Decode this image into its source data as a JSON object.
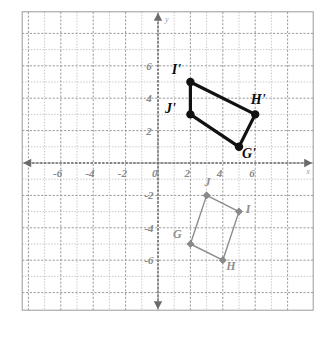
{
  "figure": {
    "type": "coordinate-plane",
    "background_color": "#ffffff",
    "grid_color": "#b9b9b9",
    "major_grid_color": "#8f8f8f",
    "axis_color": "#6b6b6b",
    "axis_names": {
      "x": "x",
      "y": "y"
    }
  },
  "axes": {
    "x_label": "x",
    "y_label": "y",
    "xlim": [
      -7.5,
      7.5
    ],
    "ylim": [
      -7.5,
      7.5
    ],
    "x_tick_labels": [
      "-6",
      "-4",
      "-2",
      "0",
      "2",
      "4",
      "6"
    ],
    "x_tick_values": [
      -6,
      -4,
      -2,
      0,
      2,
      4,
      6
    ],
    "y_tick_labels": [
      "6",
      "4",
      "2",
      "-2",
      "-4",
      "-6"
    ],
    "y_tick_values": [
      6,
      4,
      2,
      -2,
      -4,
      -6
    ],
    "origin_label": "0",
    "minor_grid_step": 1,
    "major_grid_step": 2
  },
  "chart_data": {
    "type": "scatter",
    "title": "",
    "xlabel": "x",
    "ylabel": "y",
    "xlim": [
      -7.5,
      7.5
    ],
    "ylim": [
      -7.5,
      7.5
    ],
    "grid": true,
    "legend": "none",
    "series": [
      {
        "name": "Image quadrilateral G'H'I'J'",
        "style": "solid-black-bold",
        "color": "#111111",
        "closed": true,
        "points": [
          {
            "label": "G'",
            "x": 5,
            "y": 1,
            "label_dx": 10,
            "label_dy": 11
          },
          {
            "label": "H'",
            "x": 6,
            "y": 3,
            "label_dx": 3,
            "label_dy": -10
          },
          {
            "label": "I'",
            "x": 2,
            "y": 5,
            "label_dx": -14,
            "label_dy": -8
          },
          {
            "label": "J'",
            "x": 2,
            "y": 3,
            "label_dx": -20,
            "label_dy": -1
          }
        ]
      },
      {
        "name": "Pre-image quadrilateral GHIJ",
        "style": "solid-gray-thin",
        "color": "#8c8c8c",
        "closed": true,
        "points": [
          {
            "label": "G",
            "x": 2,
            "y": -5,
            "label_dx": -13,
            "label_dy": -6
          },
          {
            "label": "H",
            "x": 4,
            "y": -6,
            "label_dx": 8,
            "label_dy": 10
          },
          {
            "label": "I",
            "x": 5,
            "y": -3,
            "label_dx": 9,
            "label_dy": 1
          },
          {
            "label": "J",
            "x": 3,
            "y": -2,
            "label_dx": 1,
            "label_dy": -9
          }
        ]
      }
    ]
  }
}
